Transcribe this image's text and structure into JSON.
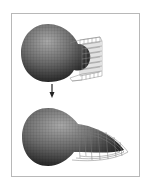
{
  "figure": {
    "panels": [
      {
        "name": "before",
        "object": "sphere with lattice box"
      },
      {
        "name": "after",
        "object": "sphere with stretched lattice tail"
      }
    ],
    "arrow": "down-arrow",
    "colors": {
      "frame": "#b8b8b8",
      "sphere_dark": "#2a2a2a",
      "sphere_light": "#9a9a9a",
      "lattice": "#8a8a8a"
    }
  }
}
